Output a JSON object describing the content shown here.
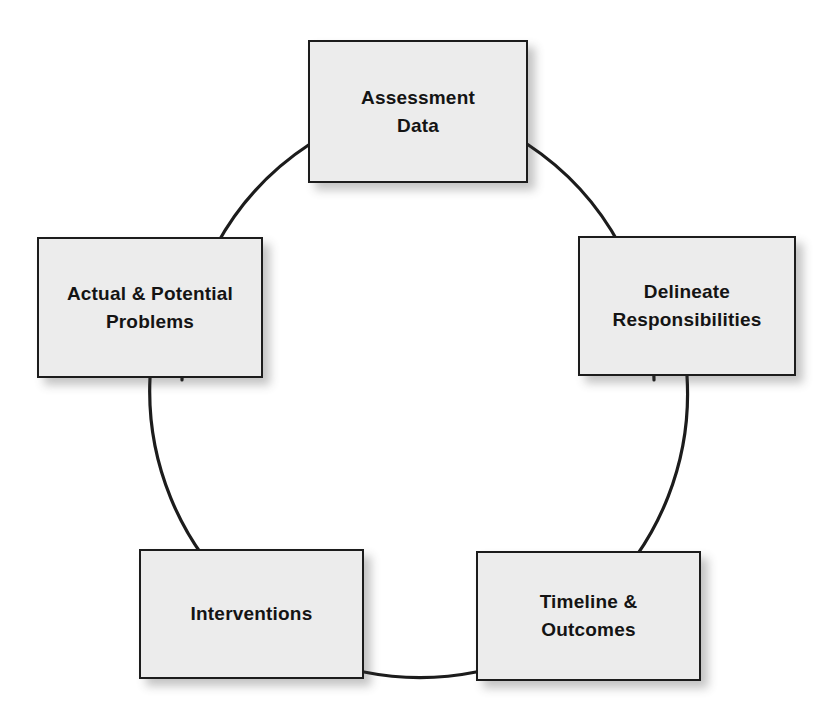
{
  "diagram": {
    "type": "cycle",
    "title": "",
    "background_color": "#ffffff",
    "node_fill_color": "#ececec",
    "node_border_color": "#1c1c1c",
    "connector_color": "#1c1c1c",
    "nodes": [
      {
        "id": "assessment-data",
        "label": "Assessment\nData",
        "position": "top"
      },
      {
        "id": "delineate-responsibilities",
        "label": "Delineate\nResponsibilities",
        "position": "upper-right"
      },
      {
        "id": "timeline-outcomes",
        "label": "Timeline &\nOutcomes",
        "position": "lower-right"
      },
      {
        "id": "interventions",
        "label": "Interventions",
        "position": "lower-left"
      },
      {
        "id": "actual-potential-problems",
        "label": "Actual & Potential\nProblems",
        "position": "upper-left"
      }
    ],
    "connectors": [
      {
        "from": "assessment-data",
        "to": "delineate-responsibilities"
      },
      {
        "from": "delineate-responsibilities",
        "to": "timeline-outcomes"
      },
      {
        "from": "timeline-outcomes",
        "to": "interventions"
      },
      {
        "from": "interventions",
        "to": "actual-potential-problems"
      },
      {
        "from": "actual-potential-problems",
        "to": "assessment-data"
      }
    ]
  }
}
